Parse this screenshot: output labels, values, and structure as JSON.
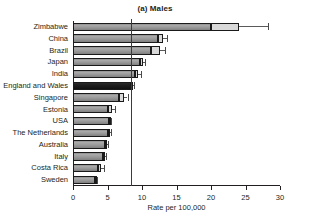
{
  "figure": {
    "panel_title": "(a) Males",
    "top_artifact_text": "",
    "xlabel": "Rate per 100,000"
  },
  "chart_data": {
    "type": "bar",
    "orientation": "horizontal",
    "title": "(a) Males",
    "xlabel": "Rate per 100,000",
    "ylabel": "",
    "xlim": [
      0,
      30
    ],
    "xticks": [
      0,
      5,
      10,
      15,
      20,
      25,
      30
    ],
    "xtick_labels": [
      "0",
      "5",
      "10",
      "15",
      "20",
      "25",
      "30"
    ],
    "grid": false,
    "legend": "none",
    "reference_line": {
      "value": 8.4,
      "label": "England and Wales rate",
      "color": "#3b3b3b"
    },
    "highlight_category": "England and Wales",
    "highlight_color": "#111111",
    "bar_color": "#9a9a9a",
    "categories": [
      "Zimbabwe",
      "China",
      "Brazil",
      "Japan",
      "India",
      "England and Wales",
      "Singapore",
      "Estonia",
      "USA",
      "The Netherlands",
      "Australia",
      "Italy",
      "Costa Rica",
      "Sweden"
    ],
    "values": [
      20.0,
      12.3,
      11.3,
      9.7,
      9.0,
      8.4,
      6.7,
      5.0,
      5.2,
      5.1,
      4.6,
      4.4,
      3.6,
      3.2
    ],
    "ci_low": [
      20.0,
      12.3,
      11.3,
      9.7,
      9.0,
      8.4,
      6.7,
      5.0,
      5.2,
      5.1,
      4.6,
      4.4,
      3.6,
      3.2
    ],
    "ci_high": [
      24.0,
      13.0,
      12.6,
      10.1,
      9.4,
      8.6,
      7.4,
      5.6,
      5.3,
      5.3,
      4.9,
      4.6,
      4.0,
      3.4
    ],
    "whisker_high": [
      28.3,
      13.6,
      13.3,
      10.5,
      9.9,
      8.8,
      7.9,
      6.1,
      5.5,
      5.5,
      5.1,
      4.8,
      4.5,
      3.5
    ],
    "series": [
      {
        "name": "Rate per 100,000",
        "values": [
          20.0,
          12.3,
          11.3,
          9.7,
          9.0,
          8.4,
          6.7,
          5.0,
          5.2,
          5.1,
          4.6,
          4.4,
          3.6,
          3.2
        ]
      }
    ]
  }
}
